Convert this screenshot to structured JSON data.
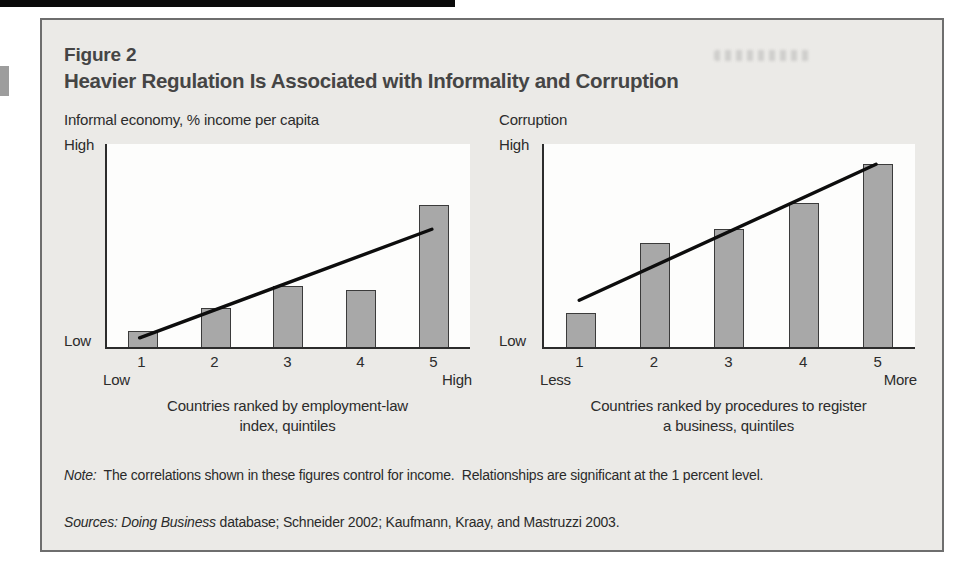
{
  "figure": {
    "label": "Figure 2",
    "title": "Heavier Regulation Is Associated with Informality and Corruption"
  },
  "chart_data": [
    {
      "type": "bar",
      "title": "Informal economy, % income per capita",
      "categories": [
        "1",
        "2",
        "3",
        "4",
        "5"
      ],
      "values": [
        8,
        19,
        30,
        28,
        70
      ],
      "value_scale": "relative height 0-100, axis unlabeled (Low to High)",
      "ylim": [
        0,
        100
      ],
      "grid": false,
      "legend": "none",
      "y_axis": {
        "top_label": "High",
        "bottom_label": "Low"
      },
      "x_axis": {
        "left_label": "Low",
        "right_label": "High",
        "caption_lines": [
          "Countries ranked by employment-law",
          "index, quintiles"
        ]
      },
      "trendline": {
        "x1_pct": 9,
        "y1": 4.5,
        "x2_pct": 89.5,
        "y2": 58
      }
    },
    {
      "type": "bar",
      "title": "Corruption",
      "categories": [
        "1",
        "2",
        "3",
        "4",
        "5"
      ],
      "values": [
        17,
        51,
        58,
        71,
        90
      ],
      "value_scale": "relative height 0-100, axis unlabeled (Low to High)",
      "ylim": [
        0,
        100
      ],
      "grid": false,
      "legend": "none",
      "y_axis": {
        "top_label": "High",
        "bottom_label": "Low"
      },
      "x_axis": {
        "left_label": "Less",
        "right_label": "More",
        "caption_lines": [
          "Countries ranked by procedures to register",
          "a business, quintiles"
        ]
      },
      "trendline": {
        "x1_pct": 9.5,
        "y1": 23,
        "x2_pct": 89.5,
        "y2": 90
      }
    }
  ],
  "note": {
    "label": "Note:",
    "text": "The correlations shown in these figures control for income.  Relationships are significant at the 1 percent level."
  },
  "sources": {
    "label": "Sources:",
    "work_italic": "Doing Business",
    "text": "database; Schneider 2002; Kaufmann, Kraay, and Mastruzzi 2003."
  },
  "colors": {
    "figure_bg": "#ebeae7",
    "figure_border": "#6e6e6e",
    "bar_fill": "#a8a8a8",
    "bar_border": "#3b3b3b",
    "trend_line": "#0d0d0d",
    "axis": "#2c2c2c",
    "text": "#2f2f2f"
  }
}
